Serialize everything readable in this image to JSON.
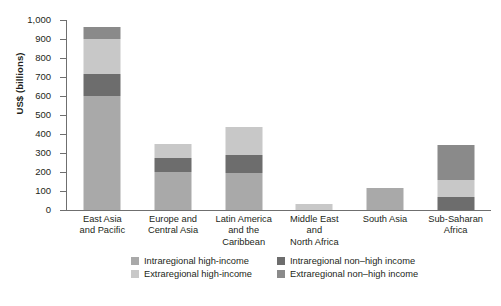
{
  "chart_data": {
    "type": "bar",
    "subtype": "stacked-bar",
    "title": "",
    "xlabel": "",
    "ylabel": "US$ (billions)",
    "ylim": [
      0,
      1000
    ],
    "yticks": [
      "0",
      "100",
      "200",
      "300",
      "400",
      "500",
      "600",
      "700",
      "800",
      "900",
      "1,000"
    ],
    "ytick_values": [
      0,
      100,
      200,
      300,
      400,
      500,
      600,
      700,
      800,
      900,
      1000
    ],
    "grid": false,
    "legend_position": "bottom",
    "categories": [
      "East Asia and Pacific",
      "Europe and Central Asia",
      "Latin America and the Caribbean",
      "Middle East and North Africa",
      "South Asia",
      "Sub-Saharan Africa"
    ],
    "category_lines": [
      [
        "East Asia",
        "and Pacific"
      ],
      [
        "Europe and",
        "Central Asia"
      ],
      [
        "Latin America",
        "and the",
        "Caribbean"
      ],
      [
        "Middle East",
        "and",
        "North Africa"
      ],
      [
        "South Asia"
      ],
      [
        "Sub-Saharan",
        "Africa"
      ]
    ],
    "series": [
      {
        "name": "Intraregional high-income",
        "color": "#a9a9a9",
        "values": [
          600,
          200,
          195,
          0,
          115,
          0
        ]
      },
      {
        "name": "Intraregional non-high income",
        "color": "#6d6d6d",
        "values": [
          115,
          75,
          95,
          0,
          0,
          70
        ]
      },
      {
        "name": "Extraregional high-income",
        "color": "#c8c8c8",
        "values": [
          185,
          70,
          145,
          30,
          0,
          90
        ]
      },
      {
        "name": "Extraregional non-high income",
        "color": "#8a8a8a",
        "values": [
          65,
          0,
          0,
          0,
          0,
          180
        ]
      }
    ],
    "totals": [
      965,
      345,
      435,
      30,
      115,
      340
    ]
  },
  "legend": {
    "items": [
      {
        "label": "Intraregional high-income",
        "color": "#a9a9a9"
      },
      {
        "label": "Intraregional non–high income",
        "color": "#6d6d6d"
      },
      {
        "label": "Extraregional high-income",
        "color": "#c8c8c8"
      },
      {
        "label": "Extraregional non–high income",
        "color": "#8a8a8a"
      }
    ]
  },
  "axis": {
    "y_title": "US$ (billions)"
  }
}
